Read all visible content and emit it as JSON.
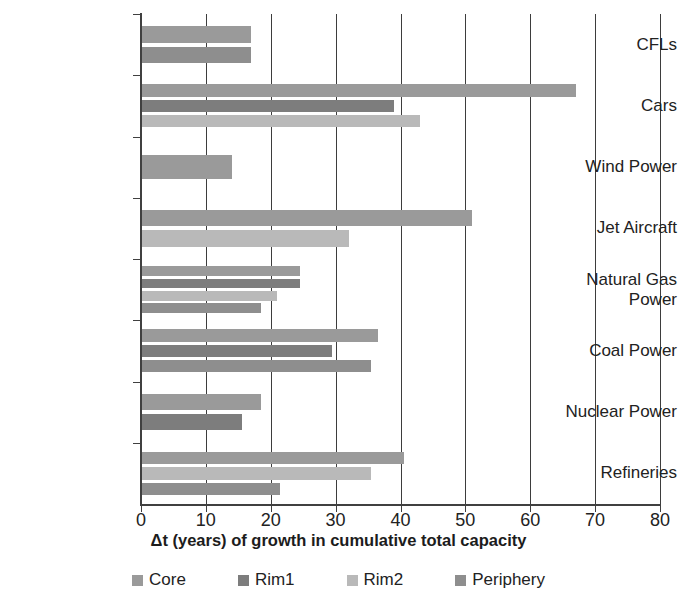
{
  "chart_data": {
    "type": "bar",
    "orientation": "horizontal",
    "title": "",
    "xlabel": "Δt (years) of growth in cumulative total capacity",
    "ylabel": "",
    "xlim": [
      0,
      80
    ],
    "xticks": [
      0,
      10,
      20,
      30,
      40,
      50,
      60,
      70,
      80
    ],
    "grid": "vertical",
    "legend_position": "bottom",
    "categories": [
      "CFLs",
      "Cars",
      "Wind Power",
      "Jet Aircraft",
      "Natural Gas\nPower",
      "Coal Power",
      "Nuclear Power",
      "Refineries"
    ],
    "series": [
      {
        "name": "Core",
        "color": "#9a9a9a",
        "values": [
          17.0,
          67.0,
          14.0,
          51.0,
          24.5,
          36.5,
          18.5,
          40.5
        ]
      },
      {
        "name": "Rim1",
        "color": "#7d7d7d",
        "values": [
          null,
          39.0,
          null,
          null,
          24.5,
          29.5,
          15.5,
          null
        ]
      },
      {
        "name": "Rim2",
        "color": "#b9b9b9",
        "values": [
          null,
          43.0,
          null,
          32.0,
          21.0,
          null,
          null,
          35.5
        ]
      },
      {
        "name": "Periphery",
        "color": "#8e8e8e",
        "values": [
          17.0,
          null,
          null,
          null,
          18.5,
          35.5,
          null,
          21.5
        ]
      }
    ]
  },
  "legend": {
    "items": [
      {
        "label": "Core",
        "color": "#9a9a9a"
      },
      {
        "label": "Rim1",
        "color": "#7d7d7d"
      },
      {
        "label": "Rim2",
        "color": "#b9b9b9"
      },
      {
        "label": "Periphery",
        "color": "#8e8e8e"
      }
    ]
  },
  "axis": {
    "x_title": "Δt (years) of growth in cumulative total capacity",
    "tick_labels": [
      "0",
      "10",
      "20",
      "30",
      "40",
      "50",
      "60",
      "70",
      "80"
    ]
  }
}
